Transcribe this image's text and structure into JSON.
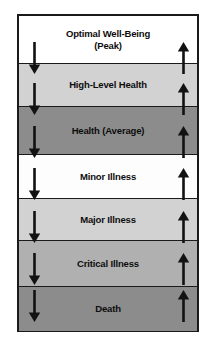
{
  "diagram": {
    "frame": {
      "border_color": "#1a1a1a",
      "x": 17,
      "y": 14,
      "width": 182,
      "height": 318
    },
    "bands": [
      {
        "id": "optimal-well-being",
        "label": "Optimal Well-Being\n(Peak)",
        "fill": "#ffffff",
        "text_color": "#0d0d0d",
        "top": 0,
        "height": 47
      },
      {
        "id": "high-level-health",
        "label": "High-Level Health",
        "fill": "#d2d2d2",
        "text_color": "#0d0d0d",
        "top": 47,
        "height": 43
      },
      {
        "id": "health-average",
        "label": "Health (Average)",
        "fill": "#8c8c8c",
        "text_color": "#0d0d0d",
        "top": 90,
        "height": 48
      },
      {
        "id": "minor-illness",
        "label": "Minor Illness",
        "fill": "#fdfdfd",
        "text_color": "#0d0d0d",
        "top": 138,
        "height": 44
      },
      {
        "id": "major-illness",
        "label": "Major Illness",
        "fill": "#d2d2d2",
        "text_color": "#0d0d0d",
        "top": 182,
        "height": 42
      },
      {
        "id": "critical-illness",
        "label": "Critical Illness",
        "fill": "#b0b0b0",
        "text_color": "#0d0d0d",
        "top": 224,
        "height": 46
      },
      {
        "id": "death",
        "label": "Death",
        "fill": "#8c8c8c",
        "text_color": "#0d0d0d",
        "top": 270,
        "height": 45
      }
    ],
    "arrows": {
      "color": "#121212",
      "descending": {
        "direction": "down",
        "semantic": "decline-toward-death",
        "x": 34,
        "count": 7,
        "positions": [
          {
            "top": 42,
            "height": 32
          },
          {
            "top": 83,
            "height": 32
          },
          {
            "top": 126,
            "height": 32
          },
          {
            "top": 168,
            "height": 32
          },
          {
            "top": 211,
            "height": 32
          },
          {
            "top": 253,
            "height": 32
          },
          {
            "top": 290,
            "height": 32
          }
        ]
      },
      "ascending": {
        "direction": "up",
        "semantic": "improvement-toward-optimal-well-being",
        "x": 183,
        "count": 7,
        "positions": [
          {
            "top": 42,
            "height": 32
          },
          {
            "top": 83,
            "height": 32
          },
          {
            "top": 126,
            "height": 32
          },
          {
            "top": 168,
            "height": 32
          },
          {
            "top": 211,
            "height": 32
          },
          {
            "top": 253,
            "height": 32
          },
          {
            "top": 290,
            "height": 32
          }
        ]
      }
    }
  }
}
